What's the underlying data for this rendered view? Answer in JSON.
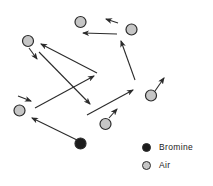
{
  "figure": {
    "width": 213,
    "height": 186,
    "background": "#ffffff",
    "colors": {
      "air_fill": "#c6c6c6",
      "bromine_fill": "#1c1c1c",
      "outline": "#2b2b2b",
      "arrow": "#2b2b2b",
      "text": "#1a1a1a"
    },
    "particle_radius": 5.5,
    "particles": [
      {
        "type": "air",
        "x": 80.5,
        "y": 22
      },
      {
        "type": "air",
        "x": 131.5,
        "y": 29.5
      },
      {
        "type": "air",
        "x": 28,
        "y": 41
      },
      {
        "type": "air",
        "x": 151,
        "y": 95.5
      },
      {
        "type": "air",
        "x": 19.5,
        "y": 110.5
      },
      {
        "type": "air",
        "x": 105.5,
        "y": 124
      },
      {
        "type": "bromine",
        "x": 80.5,
        "y": 143.5
      }
    ],
    "arrows": [
      {
        "x1": 118,
        "y1": 23,
        "x2": 106,
        "y2": 19
      },
      {
        "x1": 117,
        "y1": 34,
        "x2": 83,
        "y2": 33
      },
      {
        "x1": 135,
        "y1": 80,
        "x2": 121,
        "y2": 41
      },
      {
        "x1": 155,
        "y1": 91,
        "x2": 164,
        "y2": 78
      },
      {
        "x1": 109,
        "y1": 118,
        "x2": 117,
        "y2": 109
      },
      {
        "x1": 87,
        "y1": 115,
        "x2": 133,
        "y2": 90
      },
      {
        "x1": 77,
        "y1": 140,
        "x2": 32,
        "y2": 118
      },
      {
        "x1": 18,
        "y1": 96,
        "x2": 31,
        "y2": 101
      },
      {
        "x1": 29,
        "y1": 48,
        "x2": 37,
        "y2": 59
      },
      {
        "x1": 97,
        "y1": 73,
        "x2": 41,
        "y2": 44
      },
      {
        "x1": 39,
        "y1": 52,
        "x2": 90,
        "y2": 104
      },
      {
        "x1": 35,
        "y1": 108,
        "x2": 94,
        "y2": 76
      }
    ],
    "legend": {
      "items": [
        {
          "label": "Bromine",
          "type": "bromine"
        },
        {
          "label": "Air",
          "type": "air"
        }
      ]
    }
  }
}
